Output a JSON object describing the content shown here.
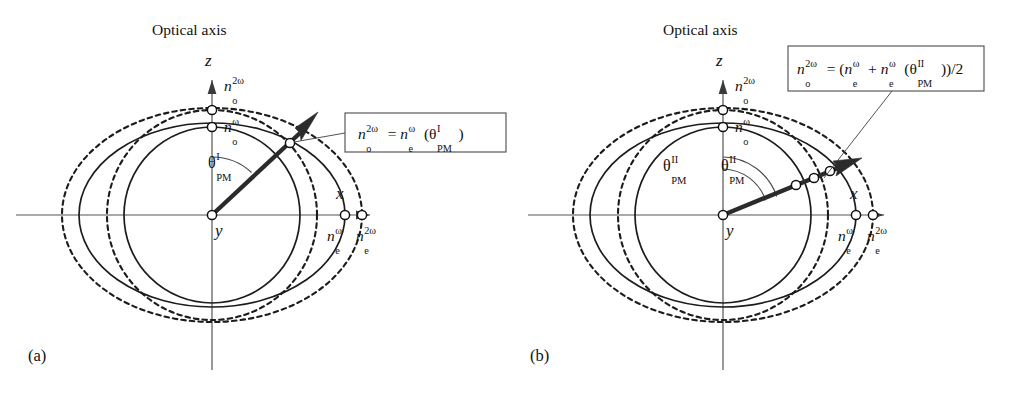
{
  "figure": {
    "background": "#ffffff",
    "ink": "#111111",
    "width": 1025,
    "height": 400,
    "caption_style": "two-panel refractive index surface diagram"
  },
  "panels": [
    {
      "id": "a",
      "panel_label": "(a)",
      "title": "Optical axis",
      "axes": {
        "vertical_label": "z",
        "horizontal_label": "x",
        "origin_label": "y"
      },
      "node_labels": {
        "z_outer": {
          "base": "n",
          "sub": "o",
          "sup": "2ω",
          "text": "n_o^{2ω}"
        },
        "z_inner": {
          "base": "n",
          "sub": "o",
          "sup": "ω",
          "text": "n_o^{ω}"
        },
        "x_inner": {
          "base": "n",
          "sub": "e",
          "sup": "ω",
          "text": "n_e^{ω}"
        },
        "x_outer": {
          "base": "n",
          "sub": "e",
          "sup": "2ω",
          "text": "n_e^{2ω}"
        }
      },
      "angle_labels": [
        {
          "base": "θ",
          "sub": "PM",
          "sup": "I",
          "text": "θ_PM^I"
        }
      ],
      "equation": {
        "text": "n_o^{2ω} = n_e^{ω}(θ_PM^I)",
        "lhs": {
          "base": "n",
          "sub": "o",
          "sup": "2ω"
        },
        "relation": "=",
        "rhs": {
          "base": "n",
          "sub": "e",
          "sup": "ω",
          "argument": "(θ_PM^I)"
        }
      },
      "ray": {
        "angle_deg": 43,
        "description": "phase-matching direction"
      },
      "intersection_count": 1
    },
    {
      "id": "b",
      "panel_label": "(b)",
      "title": "Optical axis",
      "axes": {
        "vertical_label": "z",
        "horizontal_label": "x",
        "origin_label": "y"
      },
      "node_labels": {
        "z_outer": {
          "base": "n",
          "sub": "o",
          "sup": "2ω",
          "text": "n_o^{2ω}"
        },
        "z_inner": {
          "base": "n",
          "sub": "o",
          "sup": "ω",
          "text": "n_o^{ω}"
        },
        "x_inner": {
          "base": "n",
          "sub": "e",
          "sup": "ω",
          "text": "n_e^{ω}"
        },
        "x_outer": {
          "base": "n",
          "sub": "e",
          "sup": "2ω",
          "text": "n_e^{2ω}"
        }
      },
      "angle_labels": [
        {
          "base": "θ",
          "sub": "PM",
          "sup": "II",
          "text": "θ_PM^II"
        },
        {
          "base": "θ",
          "sub": "PM",
          "sup": "II",
          "text": "θ_PM^II"
        }
      ],
      "equation": {
        "text": "n_o^{2ω} = (n_e^{ω} + n_e^{ω}(θ_PM^II))/2",
        "lhs": {
          "base": "n",
          "sub": "o",
          "sup": "2ω"
        },
        "relation": "=",
        "rhs": "(n_e^{ω} + n_e^{ω}(θ_PM^II))/2"
      },
      "ray": {
        "angle_deg": 22,
        "description": "phase-matching direction"
      },
      "intersection_count": 3
    }
  ],
  "curves": {
    "solid_count_per_panel": 2,
    "dashed_count_per_panel": 2,
    "solid_names": [
      "n_o^{ω} circle",
      "n_e^{ω} ellipse"
    ],
    "dashed_names": [
      "n_o^{2ω} circle",
      "n_e^{2ω} ellipse"
    ]
  }
}
